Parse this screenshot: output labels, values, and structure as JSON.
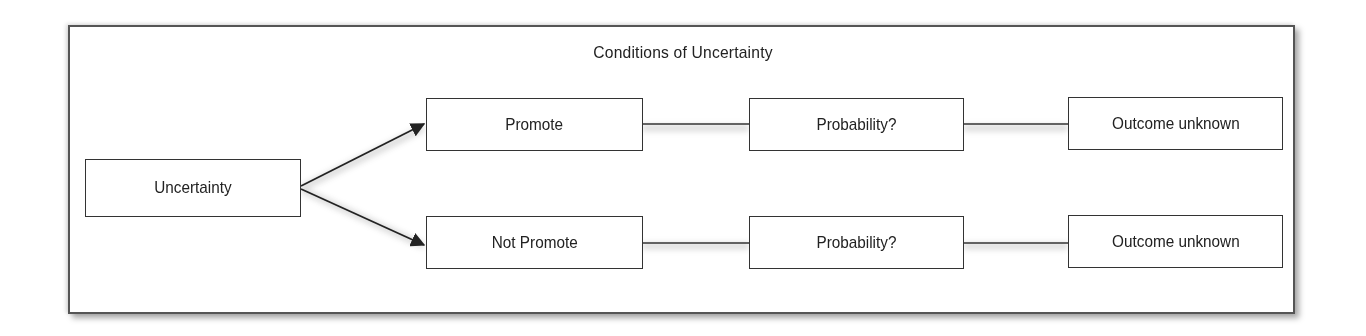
{
  "diagram": {
    "title": "Conditions of Uncertainty",
    "root": {
      "label": "Uncertainty"
    },
    "branches": [
      {
        "label": "Promote",
        "probability": "Probability?",
        "outcome": "Outcome unknown"
      },
      {
        "label": "Not Promote",
        "probability": "Probability?",
        "outcome": "Outcome unknown"
      }
    ],
    "colors": {
      "line": "#333333",
      "border": "#555555",
      "text": "#222222"
    }
  }
}
